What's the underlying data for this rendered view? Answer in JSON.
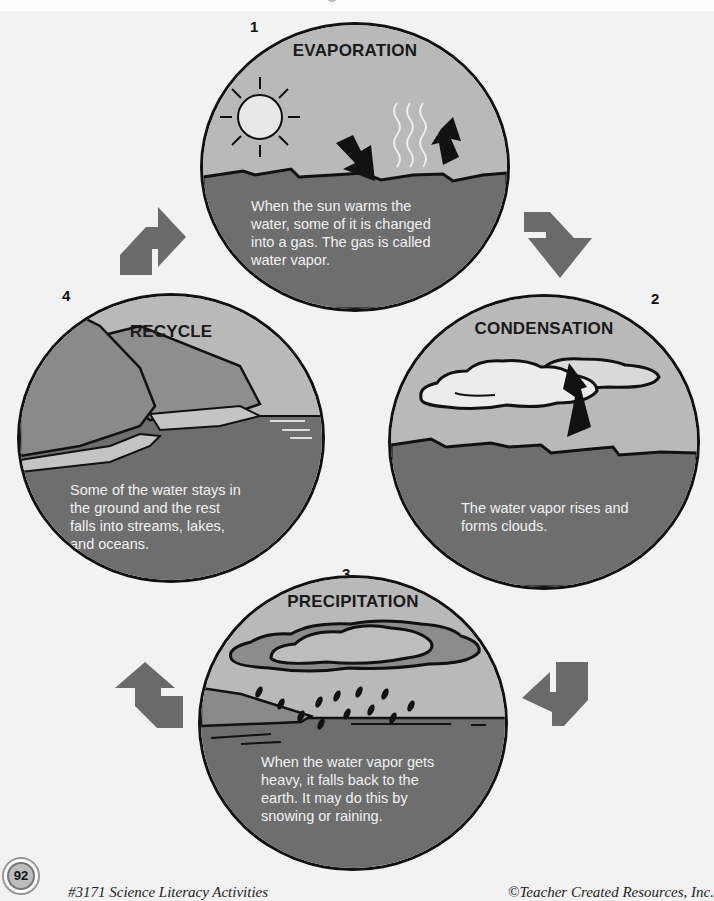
{
  "diagram": {
    "topic": "Water Cycle",
    "colors": {
      "page_background": "#f2f2f2",
      "sky": "#b9b9b9",
      "water": "#6e6e6e",
      "arrow": "#6a6a6a",
      "outline": "#111111",
      "cloud_light": "#e6e6e6",
      "description_text": "#f1f1f1"
    },
    "stages": [
      {
        "number": "1",
        "title": "EVAPORATION",
        "description_lines": [
          "When the sun warms the",
          "water, some of it is changed",
          "into a gas.  The gas is called",
          "water vapor."
        ],
        "icons": [
          "sun-icon",
          "heat-waves-icon",
          "down-arrow-icon",
          "up-arrow-icon"
        ]
      },
      {
        "number": "2",
        "title": "CONDENSATION",
        "description_lines": [
          "The water vapor rises and",
          "forms clouds."
        ],
        "icons": [
          "cloud-icon",
          "rising-arrow-icon"
        ]
      },
      {
        "number": "3",
        "title": "PRECIPITATION",
        "description_lines": [
          "When the water vapor gets",
          "heavy, it falls back to the",
          "earth.  It may do this by",
          "snowing or raining."
        ],
        "icons": [
          "rain-cloud-icon",
          "raindrops-icon",
          "shoreline-icon"
        ]
      },
      {
        "number": "4",
        "title": "RECYCLE",
        "description_lines": [
          "Some of the water stays in",
          "the ground and the rest",
          "falls into streams, lakes,",
          "and oceans."
        ],
        "icons": [
          "hills-icon",
          "stream-icon",
          "ocean-icon"
        ]
      }
    ],
    "cycle_arrows": [
      {
        "from": "4",
        "to": "1",
        "direction": "up-right"
      },
      {
        "from": "1",
        "to": "2",
        "direction": "down-right"
      },
      {
        "from": "2",
        "to": "3",
        "direction": "down-left"
      },
      {
        "from": "3",
        "to": "4",
        "direction": "up-left"
      }
    ]
  },
  "footer": {
    "page_number": "92",
    "left_text": "#3171 Science Literacy Activities",
    "right_text": "©Teacher Created Resources, Inc."
  }
}
